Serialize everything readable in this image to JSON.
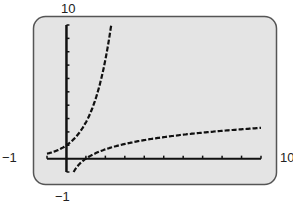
{
  "chart_data": {
    "type": "line",
    "title": "",
    "xlabel": "",
    "ylabel": "",
    "xlim": [
      -1,
      10
    ],
    "ylim": [
      -1,
      10
    ],
    "grid": false,
    "x_tick_step": 1,
    "y_tick_step": 1,
    "window_labels": {
      "ymax": "10",
      "xmin": "−1",
      "xmax": "10",
      "ymin": "−1"
    },
    "series": [
      {
        "name": "exponential curve (y = e^x)",
        "style": "dashed steps",
        "x": [
          -1,
          -0.5,
          0,
          0.5,
          1,
          1.5,
          2,
          2.3
        ],
        "y": [
          0.37,
          0.61,
          1,
          1.65,
          2.72,
          4.48,
          7.39,
          9.97
        ]
      },
      {
        "name": "logarithmic curve (y = ln x)",
        "style": "dashed steps",
        "x": [
          0.37,
          0.5,
          1,
          2,
          3,
          4,
          5,
          6,
          7,
          8,
          9,
          10
        ],
        "y": [
          -1,
          -0.69,
          0,
          0.69,
          1.1,
          1.39,
          1.61,
          1.79,
          1.95,
          2.08,
          2.2,
          2.3
        ]
      }
    ]
  },
  "colors": {
    "screen_fill": "#e4e4e4",
    "frame_border": "#555555",
    "ink": "#111111"
  }
}
